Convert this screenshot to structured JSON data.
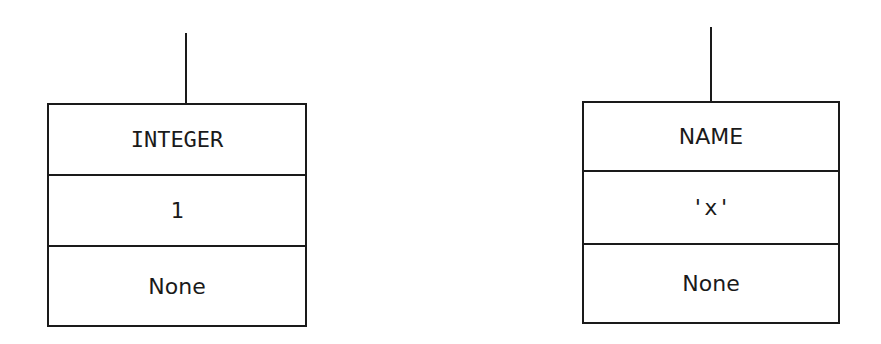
{
  "nodes": [
    {
      "type": "INTEGER",
      "value": "1",
      "next": "None"
    },
    {
      "type": "NAME",
      "value": "'x'",
      "next": "None"
    }
  ],
  "colors": {
    "stroke": "#1a1a1a",
    "background": "#ffffff"
  }
}
